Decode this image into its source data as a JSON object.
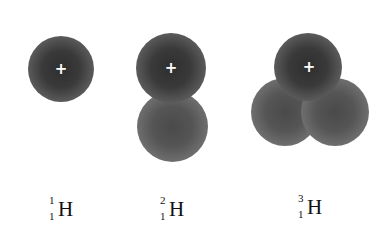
{
  "diagram": {
    "type": "hydrogen-isotopes-nuclei",
    "isotopes": [
      {
        "name": "protium",
        "mass_number": "1",
        "atomic_number": "1",
        "symbol": "H",
        "protons": 1,
        "neutrons": 0,
        "proton_mark": "+"
      },
      {
        "name": "deuterium",
        "mass_number": "2",
        "atomic_number": "1",
        "symbol": "H",
        "protons": 1,
        "neutrons": 1,
        "proton_mark": "+"
      },
      {
        "name": "tritium",
        "mass_number": "3",
        "atomic_number": "1",
        "symbol": "H",
        "protons": 1,
        "neutrons": 2,
        "proton_mark": "+"
      }
    ]
  }
}
